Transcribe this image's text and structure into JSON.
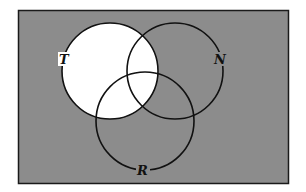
{
  "diagram": {
    "type": "venn",
    "universe": {
      "x": 18,
      "y": 10,
      "width": 271,
      "height": 174,
      "fill": "#8c8c8c",
      "stroke": "#1a1a1a"
    },
    "sets": [
      {
        "label": "T",
        "cx": 110,
        "cy": 71,
        "r": 48,
        "label_x": 65,
        "label_y": 63
      },
      {
        "label": "N",
        "cx": 175,
        "cy": 71,
        "r": 48,
        "label_x": 220,
        "label_y": 63
      },
      {
        "label": "R",
        "cx": 145,
        "cy": 121,
        "r": 49,
        "label_x": 143,
        "label_y": 175
      }
    ],
    "shaded_region": "T",
    "shaded_color": "#ffffff"
  }
}
